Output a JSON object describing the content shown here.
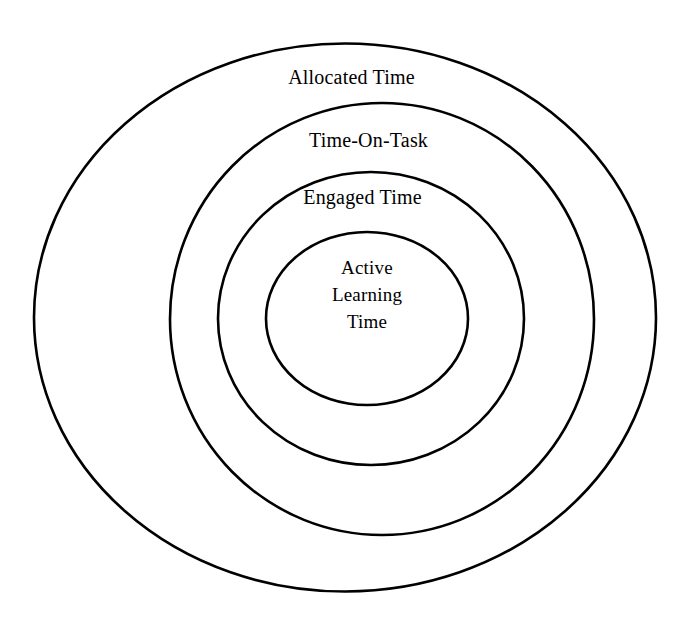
{
  "diagram": {
    "type": "concentric-rings",
    "background_color": "#ffffff",
    "stroke_color": "#000000",
    "rings": [
      {
        "id": "allocated-time",
        "label": "Allocated Time",
        "level": 1,
        "position": "outermost"
      },
      {
        "id": "time-on-task",
        "label": "Time-On-Task",
        "level": 2,
        "position": "second"
      },
      {
        "id": "engaged-time",
        "label": "Engaged Time",
        "level": 3,
        "position": "third"
      },
      {
        "id": "active-learning-time",
        "label": "Active Learning Time",
        "level": 4,
        "position": "innermost",
        "lines": [
          "Active",
          "Learning",
          "Time"
        ]
      }
    ]
  }
}
